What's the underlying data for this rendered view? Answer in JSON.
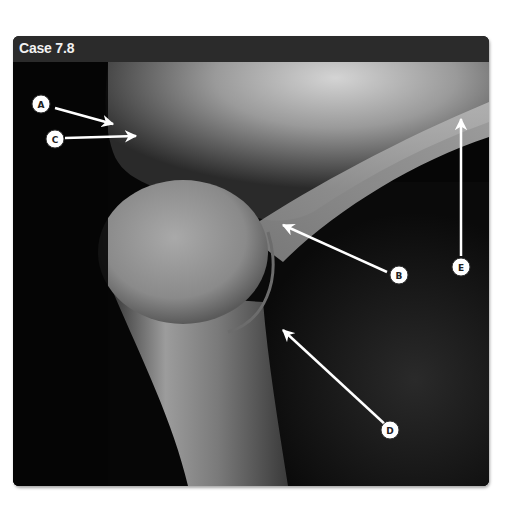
{
  "figure": {
    "title": "Case 7.8",
    "image_description": "Radiograph of shoulder (humeral head and scapula) with labeled arrows",
    "labels": [
      {
        "id": "A",
        "text": "A"
      },
      {
        "id": "B",
        "text": "B"
      },
      {
        "id": "C",
        "text": "C"
      },
      {
        "id": "D",
        "text": "D"
      },
      {
        "id": "E",
        "text": "E"
      }
    ]
  },
  "colors": {
    "header_bg": "#2b2b2b",
    "header_text": "#f2f2f2",
    "arrow": "#ffffff"
  }
}
